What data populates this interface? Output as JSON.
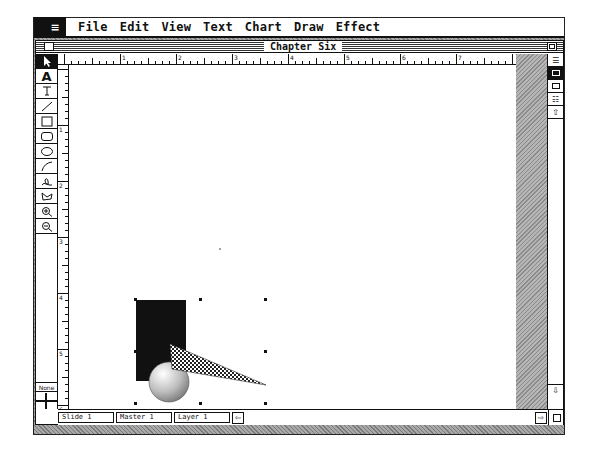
{
  "menubar": {
    "apple_icon": "apple-menu-icon",
    "items": [
      "File",
      "Edit",
      "View",
      "Text",
      "Chart",
      "Draw",
      "Effect"
    ]
  },
  "window": {
    "title": "Chapter Six"
  },
  "toolbox": {
    "tools": [
      {
        "name": "pointer",
        "icon": "▶",
        "selected": true
      },
      {
        "name": "text",
        "icon": "A"
      },
      {
        "name": "text-column",
        "icon": "⊤"
      },
      {
        "name": "line",
        "icon": "╱"
      },
      {
        "name": "rectangle",
        "icon": "□"
      },
      {
        "name": "rounded-rectangle",
        "icon": "▢"
      },
      {
        "name": "oval",
        "icon": "◯"
      },
      {
        "name": "arc",
        "icon": "◜"
      },
      {
        "name": "freehand",
        "icon": "ℓ"
      },
      {
        "name": "polygon",
        "icon": "⊿"
      },
      {
        "name": "zoom-in",
        "icon": "⊕"
      },
      {
        "name": "zoom-out",
        "icon": "⊖"
      }
    ],
    "none_label": "None"
  },
  "ruler": {
    "top_labels": [
      "1",
      "2",
      "3",
      "4",
      "5",
      "6",
      "7"
    ],
    "left_labels": [
      "1",
      "2",
      "3",
      "4",
      "5",
      "6"
    ]
  },
  "tabs": {
    "slide": "Slide 1",
    "master": "Master 1",
    "layer": "Layer 1"
  },
  "view_buttons": [
    "outline-view",
    "slide-view",
    "notes-view",
    "slide-sorter-view",
    "view-up"
  ],
  "drawing": {
    "shapes": [
      "black-rectangle",
      "shaded-sphere",
      "checkered-triangle"
    ],
    "selection_handles": 8
  }
}
